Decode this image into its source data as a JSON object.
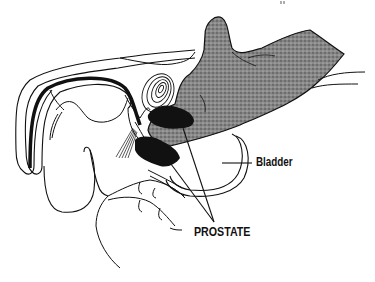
{
  "figure": {
    "type": "anatomical-illustration",
    "colors": {
      "line": "#111111",
      "fill_dark": "#111111",
      "fill_stipple": "#7a7a7a",
      "background": "#ffffff"
    }
  },
  "labels": {
    "bladder": "Bladder",
    "prostate": "PROSTATE"
  },
  "structures": [
    {
      "name": "penis-urethra",
      "fill": "outline with dark urethral channel"
    },
    {
      "name": "symphysis-pubis",
      "fill": "concentric contour lines"
    },
    {
      "name": "prostate",
      "fill": "solid black"
    },
    {
      "name": "bladder",
      "fill": "outline"
    },
    {
      "name": "examining-finger",
      "fill": "stippled gray"
    },
    {
      "name": "scrotum-testis",
      "fill": "outline"
    },
    {
      "name": "rectum-perineum",
      "fill": "outline"
    }
  ]
}
